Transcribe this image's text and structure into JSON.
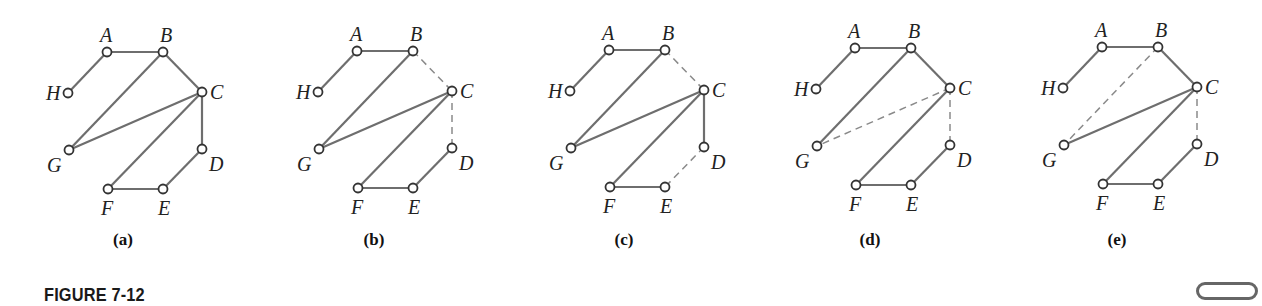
{
  "figure": {
    "title": "FIGURE 7-12",
    "icon": "rounded-pill-icon"
  },
  "colors": {
    "edge": "#6e6e6e",
    "dashed_edge": "#8a8a8a",
    "node_stroke": "#333333",
    "node_fill": "#ffffff",
    "text": "#222222"
  },
  "node_layout": {
    "H": [
      0,
      41
    ],
    "A": [
      39,
      0
    ],
    "B": [
      95,
      0
    ],
    "C": [
      134,
      40
    ],
    "D": [
      134,
      97
    ],
    "E": [
      95,
      137
    ],
    "F": [
      40,
      137
    ],
    "G": [
      1,
      98
    ]
  },
  "label_offsets": {
    "H": [
      -22,
      7
    ],
    "A": [
      -7,
      -10
    ],
    "B": [
      -3,
      -10
    ],
    "C": [
      8,
      7
    ],
    "D": [
      7,
      22
    ],
    "E": [
      -5,
      26
    ],
    "F": [
      -7,
      26
    ],
    "G": [
      -22,
      22
    ]
  },
  "subfigures": [
    {
      "caption": "(a)",
      "origin": [
        68,
        52
      ],
      "caption_pos": [
        123,
        245
      ],
      "edges": [
        {
          "from": "H",
          "to": "A",
          "style": "solid"
        },
        {
          "from": "A",
          "to": "B",
          "style": "solid"
        },
        {
          "from": "B",
          "to": "C",
          "style": "solid"
        },
        {
          "from": "B",
          "to": "G",
          "style": "solid"
        },
        {
          "from": "C",
          "to": "G",
          "style": "solid"
        },
        {
          "from": "C",
          "to": "F",
          "style": "solid"
        },
        {
          "from": "C",
          "to": "D",
          "style": "solid"
        },
        {
          "from": "D",
          "to": "E",
          "style": "solid"
        },
        {
          "from": "E",
          "to": "F",
          "style": "solid"
        }
      ]
    },
    {
      "caption": "(b)",
      "origin": [
        318,
        51
      ],
      "caption_pos": [
        374,
        245
      ],
      "edges": [
        {
          "from": "H",
          "to": "A",
          "style": "solid"
        },
        {
          "from": "A",
          "to": "B",
          "style": "solid"
        },
        {
          "from": "B",
          "to": "C",
          "style": "dashed"
        },
        {
          "from": "B",
          "to": "G",
          "style": "solid"
        },
        {
          "from": "C",
          "to": "G",
          "style": "solid"
        },
        {
          "from": "C",
          "to": "F",
          "style": "solid"
        },
        {
          "from": "C",
          "to": "D",
          "style": "dashed"
        },
        {
          "from": "D",
          "to": "E",
          "style": "solid"
        },
        {
          "from": "E",
          "to": "F",
          "style": "solid"
        }
      ]
    },
    {
      "caption": "(c)",
      "origin": [
        570,
        50
      ],
      "caption_pos": [
        624,
        245
      ],
      "edges": [
        {
          "from": "H",
          "to": "A",
          "style": "solid"
        },
        {
          "from": "A",
          "to": "B",
          "style": "solid"
        },
        {
          "from": "B",
          "to": "C",
          "style": "dashed"
        },
        {
          "from": "B",
          "to": "G",
          "style": "solid"
        },
        {
          "from": "C",
          "to": "G",
          "style": "solid"
        },
        {
          "from": "C",
          "to": "F",
          "style": "solid"
        },
        {
          "from": "C",
          "to": "D",
          "style": "solid"
        },
        {
          "from": "D",
          "to": "E",
          "style": "dashed"
        },
        {
          "from": "E",
          "to": "F",
          "style": "solid"
        }
      ]
    },
    {
      "caption": "(d)",
      "origin": [
        816,
        48
      ],
      "caption_pos": [
        870,
        245
      ],
      "edges": [
        {
          "from": "H",
          "to": "A",
          "style": "solid"
        },
        {
          "from": "A",
          "to": "B",
          "style": "solid"
        },
        {
          "from": "B",
          "to": "C",
          "style": "solid"
        },
        {
          "from": "B",
          "to": "G",
          "style": "solid"
        },
        {
          "from": "C",
          "to": "G",
          "style": "dashed"
        },
        {
          "from": "C",
          "to": "F",
          "style": "solid"
        },
        {
          "from": "C",
          "to": "D",
          "style": "dashed"
        },
        {
          "from": "D",
          "to": "E",
          "style": "solid"
        },
        {
          "from": "E",
          "to": "F",
          "style": "solid"
        }
      ]
    },
    {
      "caption": "(e)",
      "origin": [
        1063,
        47
      ],
      "caption_pos": [
        1117,
        245
      ],
      "edges": [
        {
          "from": "H",
          "to": "A",
          "style": "solid"
        },
        {
          "from": "A",
          "to": "B",
          "style": "solid"
        },
        {
          "from": "B",
          "to": "C",
          "style": "solid"
        },
        {
          "from": "B",
          "to": "G",
          "style": "dashed"
        },
        {
          "from": "C",
          "to": "G",
          "style": "solid"
        },
        {
          "from": "C",
          "to": "F",
          "style": "solid"
        },
        {
          "from": "C",
          "to": "D",
          "style": "dashed"
        },
        {
          "from": "D",
          "to": "E",
          "style": "solid"
        },
        {
          "from": "E",
          "to": "F",
          "style": "solid"
        }
      ]
    }
  ]
}
